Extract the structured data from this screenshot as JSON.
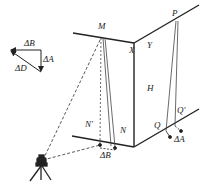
{
  "diagram": {
    "labels": {
      "M": "M",
      "X": "X",
      "Y": "Y",
      "P": "P",
      "H": "H",
      "N": "N",
      "N_prime": "N'",
      "Q": "Q",
      "Q_prime": "Q'",
      "delta_B_bottom": "ΔB",
      "delta_A_bottom": "ΔA",
      "delta_B_triangle": "ΔB",
      "delta_A_triangle": "ΔA",
      "delta_D_triangle": "ΔD"
    },
    "colors": {
      "line": "#222222",
      "background": "#ffffff"
    }
  }
}
